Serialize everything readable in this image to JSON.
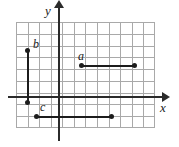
{
  "figure": {
    "background_color": "#ffffff",
    "grid_color": "#a9a9a9",
    "axis_color": "#2b2b2b",
    "segment_color": "#1c1c1c"
  },
  "axes": {
    "y_label": "y",
    "x_label": "x"
  },
  "segments": {
    "a": {
      "label": "a",
      "orientation": "horizontal"
    },
    "b": {
      "label": "b",
      "orientation": "vertical"
    },
    "c": {
      "label": "c",
      "orientation": "horizontal"
    }
  },
  "chart_data": {
    "type": "scatter",
    "title": "",
    "xlabel": "x",
    "ylabel": "y",
    "grid": true,
    "legend": "none",
    "xlim": [
      -4,
      8
    ],
    "ylim": [
      -3,
      6
    ],
    "annotations": [
      "a",
      "b",
      "c"
    ],
    "series": [
      {
        "name": "a",
        "label": "a",
        "orientation": "horizontal",
        "x": [
          2,
          7
        ],
        "y": [
          3,
          3
        ]
      },
      {
        "name": "b",
        "label": "b",
        "orientation": "vertical",
        "x": [
          -3,
          -3
        ],
        "y": [
          4,
          -1
        ]
      },
      {
        "name": "c",
        "label": "c",
        "orientation": "horizontal",
        "x": [
          -2,
          5
        ],
        "y": [
          -2,
          -2
        ]
      }
    ]
  }
}
